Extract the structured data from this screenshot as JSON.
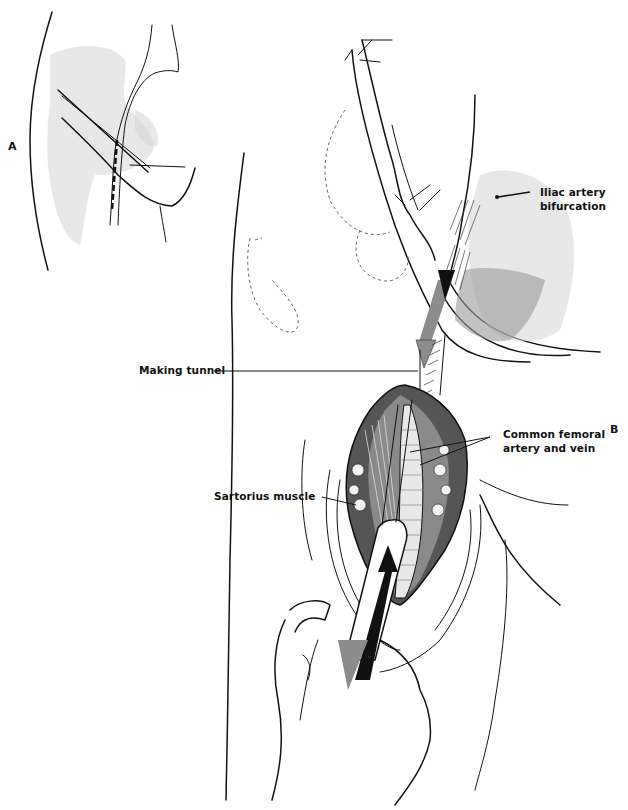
{
  "figure": {
    "panels": [
      {
        "id": "A",
        "label": "A"
      },
      {
        "id": "B",
        "label": "B"
      }
    ],
    "labels": {
      "iliac": {
        "line1": "Iliac artery",
        "line2": "bifurcation"
      },
      "tunnel": "Making tunnel",
      "femoral": {
        "line1": "Common femoral",
        "line2": "artery and vein"
      },
      "sartorius": "Sartorius muscle"
    },
    "colors": {
      "ink": "#111111",
      "shading": "#9a9a9a",
      "light_stipple": "#d6d6d6",
      "arrow_gray": "#8c8c8c",
      "background": "#ffffff"
    }
  }
}
